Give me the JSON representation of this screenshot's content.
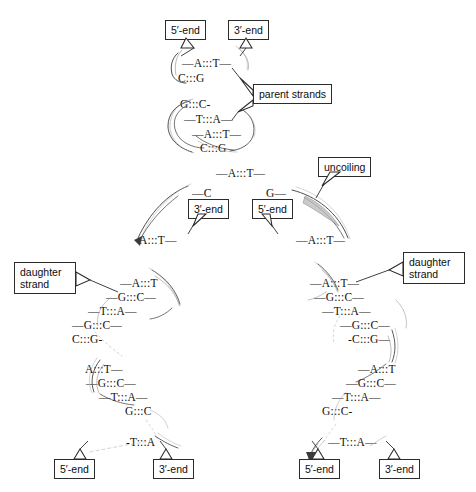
{
  "diagram": {
    "ink_color": "#121212",
    "box_border_color": "#2b2b2b",
    "background_color": "#ffffff",
    "bond_symbol": ":::"
  },
  "labels": {
    "five_prime": "5′-end",
    "three_prime": "3′-end",
    "parent_strands": "parent strands",
    "uncoiling": "uncoiling",
    "daughter_strand_line1": "daughter",
    "daughter_strand_line2": "strand"
  },
  "parent": {
    "top_pairs": [
      {
        "text": "—A:::T—"
      },
      {
        "text": "C:::G"
      }
    ],
    "lower_pairs": [
      {
        "text": "G:::C-"
      },
      {
        "text": "—T:::A—"
      },
      {
        "text": "—A:::T—"
      },
      {
        "text": "C:::G"
      }
    ],
    "five_prime_label": "5′-end",
    "three_prime_label": "3′-end",
    "callout": "parent strands"
  },
  "uncoiling_zone": {
    "top_pair": "—A:::T—",
    "left_base": "—C",
    "right_base": "G—",
    "left_bottom_pair": "A:::T—",
    "right_bottom_pair": "—A:::T—",
    "left_end_label": "3′-end",
    "right_end_label": "5′-end",
    "callout": "uncoiling"
  },
  "daughter_left": {
    "callout_line1": "daughter",
    "callout_line2": "strand",
    "upper_pairs": [
      {
        "text": "—A:::T"
      },
      {
        "text": "—G:::C—"
      },
      {
        "text": "—T:::A—"
      },
      {
        "text": "—G:::C—"
      },
      {
        "text": "C:::G-"
      }
    ],
    "lower_pairs": [
      {
        "text": "A:::T—"
      },
      {
        "text": "—G:::C—"
      },
      {
        "text": "—T:::A—"
      },
      {
        "text": "G:::C"
      }
    ],
    "final_pair": "-T:::A",
    "five_prime_label": "5′-end",
    "three_prime_label": "3′-end"
  },
  "daughter_right": {
    "callout_line1": "daughter",
    "callout_line2": "strand",
    "upper_pairs": [
      {
        "text": "—A:::T—"
      },
      {
        "text": "—G:::C—"
      },
      {
        "text": "—T:::A—"
      },
      {
        "text": "—G:::C—"
      },
      {
        "text": "-C:::G—"
      }
    ],
    "lower_pairs": [
      {
        "text": "—A:::T"
      },
      {
        "text": "—G:::C—"
      },
      {
        "text": "—T:::A—"
      },
      {
        "text": "G:::C-"
      }
    ],
    "final_pair": "—T:::A—",
    "five_prime_label": "5′-end",
    "three_prime_label": "3′-end"
  }
}
